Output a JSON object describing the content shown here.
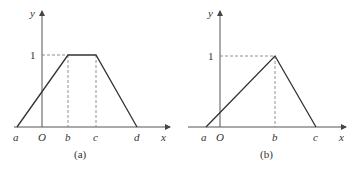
{
  "figures": [
    {
      "id": "a",
      "caption": "(a)",
      "type": "trapezoidal membership function",
      "axis_labels": {
        "x": "x",
        "y": "y",
        "origin": "O"
      },
      "y_tick": "1",
      "points": [
        "a",
        "b",
        "c",
        "d"
      ],
      "vertices": [
        {
          "label": "a",
          "x": "a",
          "y": 0
        },
        {
          "label": "b",
          "x": "b",
          "y": 1
        },
        {
          "label": "c",
          "x": "c",
          "y": 1
        },
        {
          "label": "d",
          "x": "d",
          "y": 0
        }
      ]
    },
    {
      "id": "b",
      "caption": "(b)",
      "type": "triangular membership function",
      "axis_labels": {
        "x": "x",
        "y": "y",
        "origin": "O"
      },
      "y_tick": "1",
      "points": [
        "a",
        "b",
        "c"
      ],
      "vertices": [
        {
          "label": "a",
          "x": "a",
          "y": 0
        },
        {
          "label": "b",
          "x": "b",
          "y": 1
        },
        {
          "label": "c",
          "x": "c",
          "y": 0
        }
      ]
    }
  ]
}
